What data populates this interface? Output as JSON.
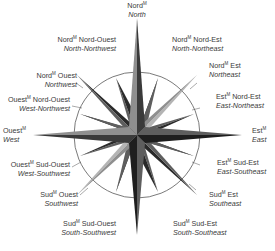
{
  "diagram": {
    "type": "compass-rose",
    "center": [
      137,
      135
    ],
    "circle_radius": 63,
    "colors": {
      "dark": "#2a2a2a",
      "mid": "#5e5e5e",
      "light": "#8f8f8f",
      "lighter": "#b4b4b4",
      "circle": "#6b6b6b"
    },
    "superscript": "M"
  },
  "labels": [
    {
      "id": "n",
      "fr_main": "Nord",
      "fr_rest": "",
      "en": "North"
    },
    {
      "id": "nne",
      "fr_main": "Nord",
      "fr_rest": " Nord-Est",
      "en": "North-Northeast"
    },
    {
      "id": "ne",
      "fr_main": "Nord",
      "fr_rest": " Est",
      "en": "Northeast"
    },
    {
      "id": "ene",
      "fr_main": "Est",
      "fr_rest": " Nord-Est",
      "en": "East-Northeast"
    },
    {
      "id": "e",
      "fr_main": "Est",
      "fr_rest": "",
      "en": "East"
    },
    {
      "id": "ese",
      "fr_main": "Est",
      "fr_rest": " Sud-Est",
      "en": "East-Southeast"
    },
    {
      "id": "se",
      "fr_main": "Sud",
      "fr_rest": " Est",
      "en": "Southeast"
    },
    {
      "id": "sse",
      "fr_main": "Sud",
      "fr_rest": " Sud-Est",
      "en": "South-Southeast"
    },
    {
      "id": "ssw",
      "fr_main": "Sud",
      "fr_rest": " Sud-Ouest",
      "en": "South-Southwest"
    },
    {
      "id": "sw",
      "fr_main": "Sud",
      "fr_rest": " Ouest",
      "en": "Southwest"
    },
    {
      "id": "wsw",
      "fr_main": "Ouest",
      "fr_rest": " Sud-Ouest",
      "en": "West-Southwest"
    },
    {
      "id": "w",
      "fr_main": "Ouest",
      "fr_rest": "",
      "en": "West"
    },
    {
      "id": "wnw",
      "fr_main": "Ouest",
      "fr_rest": " Nord-Ouest",
      "en": "West-Northwest"
    },
    {
      "id": "nw",
      "fr_main": "Nord",
      "fr_rest": " Ouest",
      "en": "Northwest"
    },
    {
      "id": "nnw",
      "fr_main": "Nord",
      "fr_rest": " Nord-Ouest",
      "en": "North-Northwest"
    }
  ]
}
